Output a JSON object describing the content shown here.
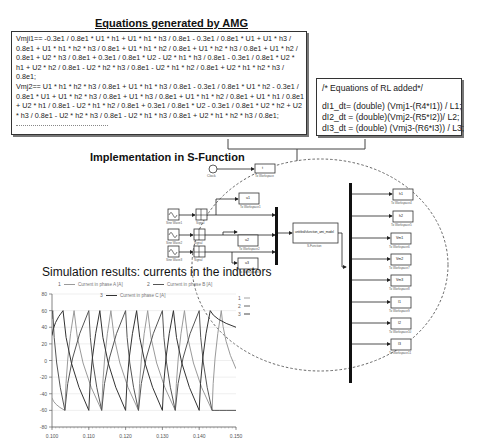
{
  "amg": {
    "title": "Equations generated by AMG",
    "lines": [
      "Vmji1== -0.3e1 / 0.8e1 * U1 * h1 + U1 * h1 * h3 / 0.8e1 - 0.3e1 / 0.8e1 * U1 + U1 * h3 /",
      "0.8e1 + U1 * h1 * h2 * h3 / 0.8e1 + U1 * h1 * h2 / 0.8e1 + U1 * h2 * h3 / 0.8e1 + U1 * h2 /",
      "0.8e1 + U2 * h3 / 0.8e1 + 0.3e1 / 0.8e1 * U2 - U2 * h1 * h3 / 0.8e1 - 0.3e1 / 0.8e1 * U2 *",
      "h1 + U2 * h2 / 0.8e1 - U2 * h2 * h3 / 0.8e1 - U2 * h1 * h2 / 0.8e1 + U2 * h1 * h2 * h3 /",
      "0.8e1;",
      "Vmj2== U1 * h1 * h2 * h3 / 0.8e1 + U1 * h1 * h3 / 0.8e1 - 0.3e1 / 0.8e1 * U1 * h2 - 0.3e1 /",
      "0.8e1 * U1 + U1 * h2 * h3 / 0.8e1 + U1 * h3 / 0.8e1 + U1 * h1 * h2 / 0.8e1 + U1 * h1 / 0.8e1",
      "+ U2 * h1 / 0.8e1 - U2 * h1 * h2 / 0.8e1 + 0.3e1 / 0.8e1 * U2 - 0.3e1 / 0.8e1 * U2 * h2 + U2",
      "* h3 / 0.8e1 - U2 * h2 * h3 / 0.8e1 - U2 * h1 * h3 / 0.8e1 + U2 * h1 * h2 * h3 / 0.8e1;"
    ],
    "continuation": "................................................"
  },
  "rl": {
    "comment": "/* Equations of RL added*/",
    "lines": [
      "dI1_dt= (double) (Vmj1-(R4*I1)) / L1;",
      "dI2_dt = (double)(Vmj2-(R5*I2))/ L2;",
      "dI3_dt = (double) (Vmj3-(R6*I3)) / L3;"
    ]
  },
  "sfunction": {
    "title": "Implementation in S-Function",
    "clock_label": "Clock",
    "sources": [
      {
        "label": "Sine Wave1",
        "relay": "Signal"
      },
      {
        "label": "Sine Wave2",
        "relay": "Signal"
      },
      {
        "label": "Sine Wave3",
        "relay": "Signal"
      }
    ],
    "inner_workspaces": [
      {
        "value": "t",
        "label": "To Workspace"
      },
      {
        "value": "u1",
        "label": "To Workspace1"
      },
      {
        "value": "u2",
        "label": "To Workspace2"
      },
      {
        "value": "u3",
        "label": "To Workspace3"
      }
    ],
    "block_name": "untitled/sfunction_ami_model",
    "block_label": "S-Function",
    "outputs": [
      {
        "value": "h1",
        "label": "To Workspace4"
      },
      {
        "value": "h2",
        "label": "To Workspace5"
      },
      {
        "value": "Vm1",
        "label": "To Workspace6"
      },
      {
        "value": "Vm2",
        "label": "To Workspace7"
      },
      {
        "value": "Vm3",
        "label": "To Workspace8"
      },
      {
        "value": "I1",
        "label": "To Workspace9"
      },
      {
        "value": "I2",
        "label": "To Workspace10"
      },
      {
        "value": "I3",
        "label": "To Workspace11"
      }
    ]
  },
  "results": {
    "title": "Simulation results: currents in the inductors"
  },
  "chart_data": {
    "type": "line",
    "title": "",
    "xlabel": "",
    "ylabel": "",
    "xlim": [
      0.1,
      0.15
    ],
    "ylim": [
      -80,
      80
    ],
    "grid": true,
    "x_ticks": [
      "0.100",
      "0.110",
      "0.120",
      "0.130",
      "0.140",
      "0.150"
    ],
    "y_ticks": [
      "80",
      "60",
      "40",
      "20",
      "0",
      "-20",
      "-40",
      "-60",
      "-80"
    ],
    "legend": [
      {
        "id": "1",
        "name": "Current in phase A [A]"
      },
      {
        "id": "2",
        "name": "Current in phase B [A]"
      },
      {
        "id": "3",
        "name": "Current in phase C [A]"
      }
    ],
    "legend_side": [
      "1",
      "2",
      "3"
    ],
    "period": 0.02,
    "peak": 60,
    "series": [
      {
        "name": "Current in phase A [A]",
        "color": "#9a9a9a",
        "x": [
          0.1,
          0.1035,
          0.106,
          0.1135,
          0.116,
          0.1235,
          0.126,
          0.1335,
          0.136,
          0.1435,
          0.146,
          0.15
        ],
        "y": [
          -45,
          -60,
          60,
          -60,
          60,
          -60,
          60,
          -60,
          60,
          -60,
          60,
          -10
        ]
      },
      {
        "name": "Current in phase B [A]",
        "color": "#555555",
        "x": [
          0.1,
          0.1002,
          0.1035,
          0.11,
          0.1135,
          0.12,
          0.1235,
          0.13,
          0.1335,
          0.14,
          0.1435,
          0.15
        ],
        "y": [
          50,
          60,
          -60,
          60,
          -60,
          60,
          -60,
          60,
          -60,
          60,
          -60,
          -60
        ]
      },
      {
        "name": "Current in phase C [A]",
        "color": "#333333",
        "x": [
          0.1,
          0.103,
          0.11,
          0.113,
          0.12,
          0.123,
          0.13,
          0.133,
          0.14,
          0.143,
          0.15
        ],
        "y": [
          30,
          60,
          -60,
          60,
          -60,
          60,
          -60,
          60,
          -60,
          60,
          40
        ]
      }
    ]
  }
}
